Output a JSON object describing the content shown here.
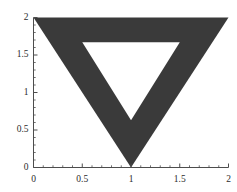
{
  "figure": {
    "background_color": "#ffffff",
    "axis_color": "#4d4d4d",
    "shape_fill_color": "#3a3a3a",
    "tick_label_color": "#2b2b2b"
  },
  "chart_data": {
    "type": "scatter",
    "title": "",
    "subtitle": "",
    "xlabel": "",
    "ylabel": "",
    "xlim": [
      0,
      2
    ],
    "ylim": [
      0,
      2
    ],
    "grid": false,
    "legend": null,
    "legend_position": "none",
    "x_ticks": [
      0,
      0.5,
      1,
      1.5,
      2
    ],
    "y_ticks": [
      0,
      0.5,
      1,
      1.5,
      2
    ],
    "x_tick_labels": [
      "0",
      "0.5",
      "1",
      "1.5",
      "2"
    ],
    "y_tick_labels": [
      "0",
      "0.5",
      "1",
      "1.5",
      "2"
    ],
    "x_minor_tick_count": 4,
    "y_minor_tick_count": 4,
    "annotations": [],
    "shapes": [
      {
        "name": "outer-triangle",
        "type": "polygon",
        "fill": "#3a3a3a",
        "vertices": [
          [
            0,
            2
          ],
          [
            2,
            2
          ],
          [
            1,
            0
          ]
        ]
      },
      {
        "name": "inner-triangle-hole",
        "type": "polygon",
        "fill": "#ffffff",
        "vertices": [
          [
            0.5,
            1.67
          ],
          [
            1.5,
            1.67
          ],
          [
            1,
            0.63
          ]
        ]
      }
    ]
  }
}
